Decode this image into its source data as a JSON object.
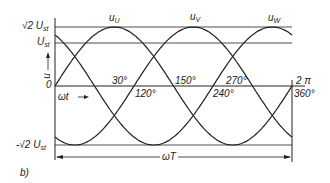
{
  "diagram": {
    "curves": [
      {
        "name": "u_U",
        "label": "u",
        "sub": "U",
        "phase_deg": 0
      },
      {
        "name": "u_V",
        "label": "u",
        "sub": "V",
        "phase_deg": 120
      },
      {
        "name": "u_W",
        "label": "u",
        "sub": "W",
        "phase_deg": 240
      }
    ],
    "y_labels": {
      "top": "√2 U",
      "top_sub": "st",
      "mid": "U",
      "mid_sub": "st",
      "bottom": "-√2 U",
      "bottom_sub": "st",
      "zero": "0",
      "axis": "u"
    },
    "x_labels": {
      "a30": "30°",
      "a120": "120°",
      "a150": "150°",
      "a240": "240°",
      "a270": "270°",
      "a360": "360°",
      "two_pi": "2 π",
      "omega_t": "ωt",
      "omega_T": "ωT"
    },
    "caption": "b)",
    "colors": {
      "line": "#222222",
      "background": "#ffffff"
    }
  }
}
